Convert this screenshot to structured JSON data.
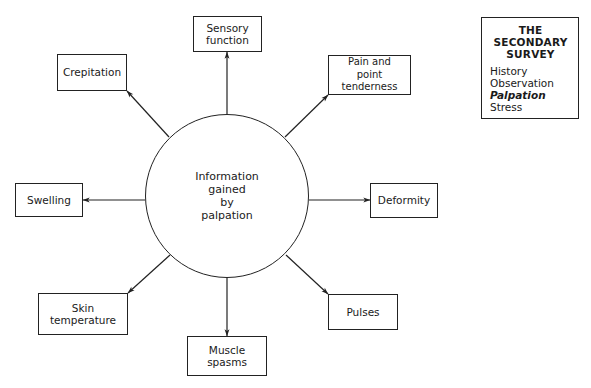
{
  "diagram": {
    "type": "radial-concept-map",
    "center": {
      "label": "Information\ngained\nby\npalpation"
    },
    "nodes": [
      {
        "id": "sensory",
        "label": "Sensory\nfunction",
        "direction": "up"
      },
      {
        "id": "pain",
        "label": "Pain and\npoint tenderness",
        "direction": "up-right"
      },
      {
        "id": "deformity",
        "label": "Deformity",
        "direction": "right"
      },
      {
        "id": "pulses",
        "label": "Pulses",
        "direction": "down-right"
      },
      {
        "id": "muscle",
        "label": "Muscle\nspasms",
        "direction": "down"
      },
      {
        "id": "skin",
        "label": "Skin\ntemperature",
        "direction": "down-left"
      },
      {
        "id": "swelling",
        "label": "Swelling",
        "direction": "left"
      },
      {
        "id": "crepitation",
        "label": "Crepitation",
        "direction": "up-left"
      }
    ],
    "edges": [
      {
        "from": "center",
        "to": "sensory",
        "arrow": "to"
      },
      {
        "from": "center",
        "to": "pain",
        "arrow": "to"
      },
      {
        "from": "center",
        "to": "deformity",
        "arrow": "to"
      },
      {
        "from": "center",
        "to": "pulses",
        "arrow": "to"
      },
      {
        "from": "center",
        "to": "muscle",
        "arrow": "to"
      },
      {
        "from": "center",
        "to": "skin",
        "arrow": "to"
      },
      {
        "from": "center",
        "to": "swelling",
        "arrow": "to"
      },
      {
        "from": "center",
        "to": "crepitation",
        "arrow": "to"
      }
    ]
  },
  "sidebar": {
    "title": "THE\nSECONDARY\nSURVEY",
    "items": [
      {
        "label": "History",
        "active": false
      },
      {
        "label": "Observation",
        "active": false
      },
      {
        "label": "Palpation",
        "active": true
      },
      {
        "label": "Stress",
        "active": false
      }
    ]
  },
  "colors": {
    "line": "#222222",
    "background": "#ffffff",
    "text": "#1a1a1a"
  }
}
